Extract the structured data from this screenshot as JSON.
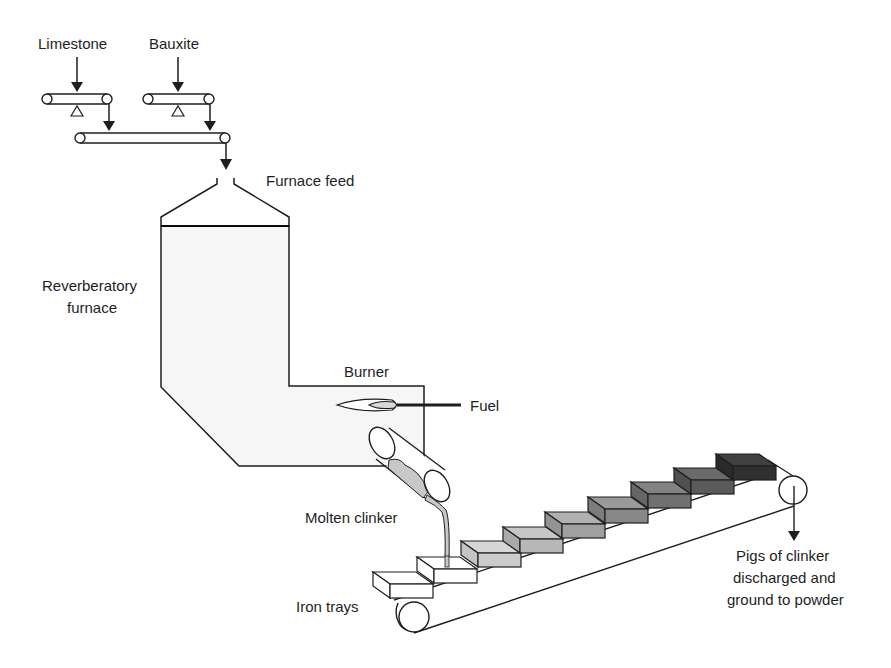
{
  "diagram": {
    "type": "process-flow",
    "labels": {
      "limestone": "Limestone",
      "bauxite": "Bauxite",
      "furnace_feed": "Furnace feed",
      "reverberatory_1": "Reverberatory",
      "reverberatory_2": "furnace",
      "burner": "Burner",
      "fuel": "Fuel",
      "molten_clinker": "Molten clinker",
      "iron_trays": "Iron trays",
      "pigs_1": "Pigs of clinker",
      "pigs_2": "discharged and",
      "pigs_3": "ground to powder"
    },
    "nodes": [
      "Limestone conveyor",
      "Bauxite conveyor",
      "Collecting conveyor",
      "Furnace feed",
      "Reverberatory furnace",
      "Burner",
      "Tilting ladle",
      "Iron trays conveyor",
      "Discharge"
    ],
    "edges": [
      [
        "Limestone",
        "Limestone conveyor"
      ],
      [
        "Bauxite",
        "Bauxite conveyor"
      ],
      [
        "Limestone conveyor",
        "Collecting conveyor"
      ],
      [
        "Bauxite conveyor",
        "Collecting conveyor"
      ],
      [
        "Collecting conveyor",
        "Furnace feed"
      ],
      [
        "Furnace feed",
        "Reverberatory furnace"
      ],
      [
        "Fuel",
        "Burner"
      ],
      [
        "Reverberatory furnace",
        "Molten clinker"
      ],
      [
        "Molten clinker",
        "Iron trays"
      ],
      [
        "Iron trays",
        "Pigs of clinker discharged and ground to powder"
      ]
    ],
    "colors": {
      "line": "#1e1e1e",
      "furnace_top": "#0a0a0a",
      "furnace_bottom": "#f4f4f4",
      "clinker": "#c8c8c8"
    }
  }
}
